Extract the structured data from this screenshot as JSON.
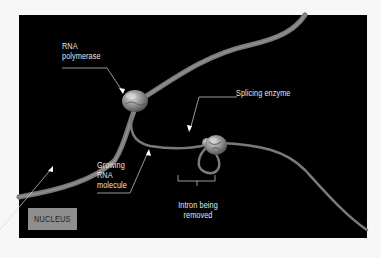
{
  "diagram": {
    "type": "illustration",
    "background_color": "#000000",
    "labels": {
      "rna_polymerase": "RNA\npolymerase",
      "rna_polymerase_line1": "RNA",
      "rna_polymerase_line2": "polymerase",
      "splicing_enzyme": "Splicing enzyme",
      "growing_rna_line1": "Growing",
      "growing_rna_line2": "RNA",
      "growing_rna_line3": "molecule",
      "intron_line1": "Intron being",
      "intron_line2": "removed",
      "nucleus": "NUCLEUS"
    },
    "colors": {
      "strand": "#8a8a8a",
      "label_text": "#e6e6e6",
      "nucleus_box": "#8e8e8e",
      "leader_line": "#d8d8d8"
    }
  }
}
